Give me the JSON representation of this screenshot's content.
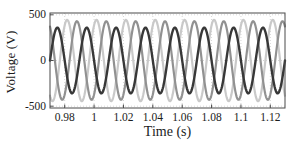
{
  "figure": {
    "background": "#ffffff"
  },
  "chart_data": {
    "type": "line",
    "title": "",
    "xlabel": "Time (s)",
    "ylabel": "Voltage (V)",
    "xlim": [
      0.97,
      1.13
    ],
    "ylim": [
      -520,
      520
    ],
    "x_ticks": [
      0.98,
      1.0,
      1.02,
      1.04,
      1.06,
      1.08,
      1.1,
      1.12
    ],
    "x_tick_labels": [
      "0.98",
      "1",
      "1.02",
      "1.04",
      "1.06",
      "1.08",
      "1.1",
      "1.12"
    ],
    "y_ticks": [
      500,
      0,
      -500
    ],
    "y_tick_labels": [
      "500",
      "0",
      "-500"
    ],
    "grid": true,
    "legend": "none",
    "waveform": "sine",
    "frequency_hz": 50,
    "series": [
      {
        "name": "phase-light-gray",
        "color": "#c9c9c9",
        "amplitude_v": 445,
        "peak_time_s": 0.98167,
        "stroke_width": 2.2
      },
      {
        "name": "phase-medium-gray",
        "color": "#919191",
        "amplitude_v": 430,
        "peak_time_s": 0.98833,
        "stroke_width": 2.2
      },
      {
        "name": "phase-dark",
        "color": "#383838",
        "amplitude_v": 360,
        "peak_time_s": 0.975,
        "stroke_width": 2.4
      }
    ],
    "axis_color": "#4a4a4a",
    "grid_color": "#d6d6d6",
    "text_color": "#1c1c1c"
  }
}
